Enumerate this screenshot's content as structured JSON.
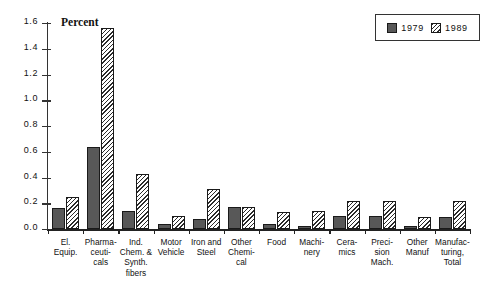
{
  "chart_data": {
    "type": "bar",
    "title": "",
    "ylabel": "Percent",
    "xlabel": "",
    "ylim": [
      0.0,
      1.6
    ],
    "yticks": [
      "0.0",
      "0.2",
      "0.4",
      "0.6",
      "0.8",
      "1.0",
      "1.2",
      "1.4",
      "1.6"
    ],
    "grid": false,
    "legend_position": "top-right",
    "categories": [
      "El. Equip.",
      "Pharma-ceuti-cals",
      "Ind. Chem. & Synth. fibers",
      "Motor Vehicle",
      "Iron and Steel",
      "Other Chemi-cal",
      "Food",
      "Machi-nery",
      "Cera-mics",
      "Preci-sion Mach.",
      "Other Manuf",
      "Manufac-turing, Total"
    ],
    "category_lines": [
      [
        "El.",
        "Equip."
      ],
      [
        "Pharma-",
        "ceuti-",
        "cals"
      ],
      [
        "Ind.",
        "Chem. &",
        "Synth.",
        "fibers"
      ],
      [
        "Motor",
        "Vehicle"
      ],
      [
        "Iron and",
        "Steel"
      ],
      [
        "Other",
        "Chemi-",
        "cal"
      ],
      [
        "Food"
      ],
      [
        "Machi-",
        "nery"
      ],
      [
        "Cera-",
        "mics"
      ],
      [
        "Preci-",
        "sion",
        "Mach."
      ],
      [
        "Other",
        "Manuf"
      ],
      [
        "Manufac-",
        "turing,",
        "Total"
      ]
    ],
    "series": [
      {
        "name": "1979",
        "color": "#585858",
        "pattern": "solid",
        "values": [
          0.16,
          0.64,
          0.14,
          0.04,
          0.08,
          0.17,
          0.04,
          0.02,
          0.1,
          0.1,
          0.02,
          0.09
        ]
      },
      {
        "name": "1989",
        "color": "#ffffff",
        "pattern": "diagonal-hatch",
        "values": [
          0.25,
          1.56,
          0.43,
          0.1,
          0.31,
          0.17,
          0.13,
          0.14,
          0.22,
          0.22,
          0.09,
          0.22
        ]
      }
    ]
  },
  "legend": {
    "items": [
      {
        "label": "1979"
      },
      {
        "label": "1989"
      }
    ]
  }
}
